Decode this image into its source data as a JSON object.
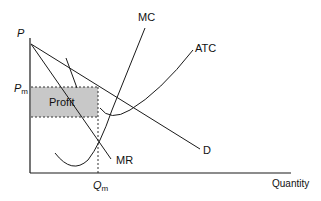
{
  "diagram": {
    "axes": {
      "y_label": "P",
      "x_label": "Quantity"
    },
    "levels": {
      "price_label": "P",
      "price_sub": "m",
      "quantity_label": "Q",
      "quantity_sub": "m"
    },
    "curves": {
      "mc": "MC",
      "atc": "ATC",
      "mr": "MR",
      "demand": "D"
    },
    "areas": {
      "profit": "Profit"
    },
    "colors": {
      "profit_fill": "#c8c8c8",
      "line": "#1a1a1a"
    }
  }
}
